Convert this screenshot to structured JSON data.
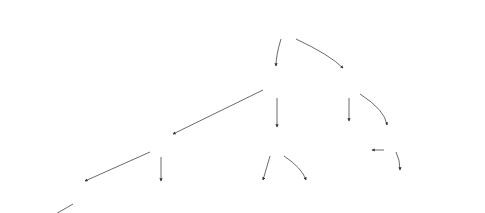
{
  "diagram": {
    "type": "decision-tree",
    "nodes": [
      {
        "id": "n0",
        "label": "x3<11",
        "kind": "split"
      },
      {
        "id": "n1",
        "label": "x1<1",
        "kind": "split"
      },
      {
        "id": "n2",
        "label": "x3<20",
        "kind": "split"
      },
      {
        "id": "n3",
        "label": "x3<2",
        "kind": "split"
      },
      {
        "id": "n4",
        "label": "x4<1",
        "kind": "split"
      },
      {
        "id": "n5",
        "label": "leaf=-0.0236555",
        "kind": "leaf"
      },
      {
        "id": "n6",
        "label": "x1<1",
        "kind": "split"
      },
      {
        "id": "n7",
        "label": "x5<3",
        "kind": "split"
      },
      {
        "id": "n8",
        "label": "x3<7",
        "kind": "split"
      },
      {
        "id": "n9",
        "label": "x5<2",
        "kind": "split"
      },
      {
        "id": "n10",
        "label": "x4<2",
        "kind": "split"
      },
      {
        "id": "n11",
        "label": "leaf=-0.0184968",
        "kind": "leaf"
      },
      {
        "id": "n12",
        "label": "x4<2",
        "kind": "split"
      },
      {
        "id": "n13",
        "label": "leaf=-0.00119384",
        "kind": "leaf"
      },
      {
        "id": "n14",
        "label": "leaf=-0.0130271",
        "kind": "leaf"
      },
      {
        "id": "n15",
        "label": "leaf=-0.000024879",
        "kind": "leaf"
      },
      {
        "id": "n16",
        "label": "leaf=-0.0100222",
        "kind": "leaf"
      },
      {
        "id": "n17",
        "label": "leaf=-0.00082354",
        "kind": "leaf"
      },
      {
        "id": "n18",
        "label": "leaf=-0.0084999",
        "kind": "leaf"
      },
      {
        "id": "n19",
        "label": "leaf=-0.00377618",
        "kind": "leaf"
      },
      {
        "id": "n20",
        "label": "leaf=-0.00540926",
        "kind": "leaf"
      },
      {
        "id": "n21",
        "label": "leaf=-0.00266977",
        "kind": "leaf"
      },
      {
        "id": "n22",
        "label": "leaf=-0.00427979",
        "kind": "leaf"
      }
    ],
    "edges": [
      {
        "from": "n0",
        "to": "n1",
        "label": "yes, missing"
      },
      {
        "from": "n0",
        "to": "n2",
        "label": "no"
      },
      {
        "from": "n1",
        "to": "n3",
        "label": "yes, missing"
      },
      {
        "from": "n1",
        "to": "n4",
        "label": "no"
      },
      {
        "from": "n2",
        "to": "n5",
        "label": "yes, missing"
      },
      {
        "from": "n2",
        "to": "n6",
        "label": "no"
      },
      {
        "from": "n3",
        "to": "n7",
        "label": "yes, missing"
      },
      {
        "from": "n3",
        "to": "n8",
        "label": "no"
      },
      {
        "from": "n4",
        "to": "n9",
        "label": "yes, missing"
      },
      {
        "from": "n4",
        "to": "n10",
        "label": "no"
      },
      {
        "from": "n6",
        "to": "n11",
        "label": "yes, missing"
      },
      {
        "from": "n6",
        "to": "n12",
        "label": "no"
      },
      {
        "from": "n7",
        "to": "n13",
        "label": "yes, missing"
      },
      {
        "from": "n7",
        "to": "n14",
        "label": "no"
      },
      {
        "from": "n8",
        "to": "n15",
        "label": "yes, missing"
      },
      {
        "from": "n8",
        "to": "n16",
        "label": "no"
      },
      {
        "from": "n9",
        "to": "n17",
        "label": "yes, missing"
      },
      {
        "from": "n9",
        "to": "n18",
        "label": "no"
      },
      {
        "from": "n10",
        "to": "n19",
        "label": "yes, missing"
      },
      {
        "from": "n10",
        "to": "n20",
        "label": "no"
      },
      {
        "from": "n12",
        "to": "n21",
        "label": "yes, missing"
      },
      {
        "from": "n12",
        "to": "n22",
        "label": "no"
      }
    ]
  }
}
